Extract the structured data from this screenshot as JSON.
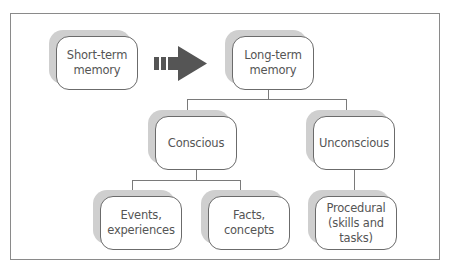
{
  "diagram": {
    "type": "memory-hierarchy",
    "nodes": {
      "short_term": "Short-term\nmemory",
      "long_term": "Long-term\nmemory",
      "conscious": "Conscious",
      "unconscious": "Unconscious",
      "events": "Events,\nexperiences",
      "facts": "Facts,\nconcepts",
      "procedural": "Procedural\n(skills and\ntasks)"
    },
    "edges": [
      {
        "from": "short_term",
        "to": "long_term",
        "style": "dashed-arrow"
      },
      {
        "from": "long_term",
        "to": "conscious"
      },
      {
        "from": "long_term",
        "to": "unconscious"
      },
      {
        "from": "conscious",
        "to": "events"
      },
      {
        "from": "conscious",
        "to": "facts"
      },
      {
        "from": "unconscious",
        "to": "procedural"
      }
    ],
    "colors": {
      "arrow": "#555555",
      "box_border": "#6b6b6b",
      "shadow": "#cfcfcf",
      "text": "#555555",
      "connector": "#7a7a7a"
    }
  }
}
